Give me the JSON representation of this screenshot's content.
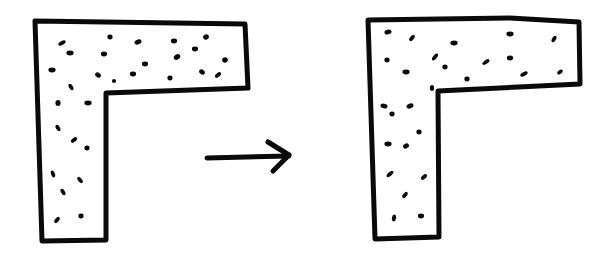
{
  "diagram": {
    "colors": {
      "ink": "#0a0a0a",
      "background": "#ffffff"
    },
    "panels": [
      {
        "id": "before",
        "shape": "L-shape",
        "outline": [
          [
            35,
            21
          ],
          [
            245,
            24
          ],
          [
            248,
            88
          ],
          [
            106,
            93
          ],
          [
            106,
            240
          ],
          [
            42,
            241
          ]
        ],
        "particles": [
          [
            62,
            43,
            7,
            3,
            -30
          ],
          [
            70,
            53,
            6,
            4,
            0
          ],
          [
            110,
            37,
            4,
            4,
            0
          ],
          [
            138,
            42,
            6,
            4,
            -20
          ],
          [
            104,
            54,
            5,
            4,
            0
          ],
          [
            174,
            41,
            5,
            4,
            0
          ],
          [
            195,
            49,
            5,
            4,
            0
          ],
          [
            206,
            37,
            4,
            5,
            60
          ],
          [
            177,
            57,
            4,
            6,
            60
          ],
          [
            52,
            70,
            6,
            4,
            0
          ],
          [
            145,
            64,
            5,
            4,
            0
          ],
          [
            98,
            75,
            5,
            4,
            40
          ],
          [
            114,
            81,
            3,
            3,
            0
          ],
          [
            133,
            74,
            5,
            4,
            0
          ],
          [
            170,
            78,
            4,
            4,
            0
          ],
          [
            202,
            72,
            5,
            4,
            40
          ],
          [
            218,
            75,
            6,
            3,
            -40
          ],
          [
            225,
            60,
            4,
            5,
            70
          ],
          [
            71,
            87,
            6,
            3,
            60
          ],
          [
            58,
            103,
            4,
            5,
            0
          ],
          [
            88,
            103,
            6,
            4,
            0
          ],
          [
            58,
            128,
            6,
            3,
            60
          ],
          [
            74,
            140,
            6,
            3,
            -40
          ],
          [
            87,
            148,
            4,
            4,
            0
          ],
          [
            53,
            174,
            6,
            3,
            70
          ],
          [
            80,
            180,
            6,
            3,
            50
          ],
          [
            63,
            192,
            6,
            3,
            60
          ],
          [
            57,
            220,
            6,
            3,
            -50
          ],
          [
            81,
            216,
            4,
            4,
            0
          ]
        ]
      },
      {
        "id": "after",
        "shape": "L-shape",
        "outline": [
          [
            368,
            20
          ],
          [
            510,
            18
          ],
          [
            579,
            22
          ],
          [
            580,
            84
          ],
          [
            438,
            91
          ],
          [
            439,
            237
          ],
          [
            375,
            239
          ]
        ],
        "particles": [
          [
            388,
            32,
            6,
            4,
            -10
          ],
          [
            412,
            38,
            6,
            3,
            -50
          ],
          [
            454,
            43,
            6,
            4,
            0
          ],
          [
            510,
            34,
            6,
            4,
            0
          ],
          [
            554,
            39,
            6,
            3,
            -60
          ],
          [
            387,
            60,
            4,
            4,
            0
          ],
          [
            435,
            57,
            7,
            3,
            -50
          ],
          [
            445,
            67,
            4,
            4,
            0
          ],
          [
            486,
            62,
            7,
            3,
            -35
          ],
          [
            510,
            58,
            5,
            4,
            0
          ],
          [
            406,
            72,
            6,
            4,
            0
          ],
          [
            467,
            79,
            4,
            4,
            0
          ],
          [
            524,
            74,
            7,
            3,
            -30
          ],
          [
            560,
            72,
            5,
            3,
            -40
          ],
          [
            432,
            88,
            3,
            5,
            0
          ],
          [
            384,
            106,
            6,
            4,
            10
          ],
          [
            392,
            114,
            4,
            4,
            0
          ],
          [
            410,
            106,
            6,
            4,
            -20
          ],
          [
            419,
            132,
            4,
            4,
            0
          ],
          [
            388,
            144,
            6,
            4,
            0
          ],
          [
            406,
            146,
            5,
            4,
            -30
          ],
          [
            390,
            174,
            7,
            3,
            -40
          ],
          [
            424,
            177,
            6,
            3,
            -40
          ],
          [
            405,
            195,
            6,
            3,
            -50
          ],
          [
            394,
            218,
            3,
            6,
            10
          ],
          [
            421,
            216,
            5,
            4,
            0
          ]
        ]
      }
    ],
    "arrow": {
      "label": "transition-arrow",
      "shaft": [
        [
          207,
          158
        ],
        [
          289,
          156
        ]
      ],
      "head": [
        [
          268,
          142
        ],
        [
          289,
          155
        ],
        [
          273,
          171
        ]
      ]
    }
  }
}
